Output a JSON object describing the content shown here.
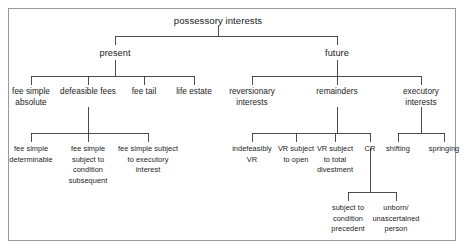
{
  "diagram": {
    "title": "possessory interests",
    "type": "tree-hierarchy",
    "frame": {
      "border_color": "#9a9a9a",
      "background": "#ffffff"
    },
    "line_color": "#3a3a3a",
    "text_color": "#1a1a1a",
    "nodes": {
      "root": "possessory interests",
      "present": "present",
      "future": "future",
      "fee_simple_absolute": "fee simple absolute",
      "defeasible_fees": "defeasible fees",
      "fee_tail": "fee tail",
      "life_estate": "life estate",
      "fee_simple_determinable": "fee simple determinable",
      "fee_simple_subject_to_condition_subsequent": "fee simple subject to condition subsequent",
      "fee_simple_subject_to_executory_interest": "fee simple subject to executory interest",
      "reversionary_interests": "reversionary interests",
      "remainders": "remainders",
      "executory_interests": "executory interests",
      "indefeasibly_vr": "indefeasibly VR",
      "vr_subject_to_open": "VR subject to open",
      "vr_subject_to_total_divestment": "VR subject to total divestment",
      "cr": "CR",
      "shifting": "shifting",
      "springing": "springing",
      "subject_to_condition_precedent": "subject to condition precedent",
      "unborn_unascertained_person": "unborn/ unascertained person"
    },
    "edges": [
      {
        "from": "root",
        "to": "present"
      },
      {
        "from": "root",
        "to": "future"
      },
      {
        "from": "present",
        "to": "fee_simple_absolute"
      },
      {
        "from": "present",
        "to": "defeasible_fees"
      },
      {
        "from": "present",
        "to": "fee_tail"
      },
      {
        "from": "present",
        "to": "life_estate"
      },
      {
        "from": "defeasible_fees",
        "to": "fee_simple_determinable"
      },
      {
        "from": "defeasible_fees",
        "to": "fee_simple_subject_to_condition_subsequent"
      },
      {
        "from": "defeasible_fees",
        "to": "fee_simple_subject_to_executory_interest"
      },
      {
        "from": "future",
        "to": "reversionary_interests"
      },
      {
        "from": "future",
        "to": "remainders"
      },
      {
        "from": "future",
        "to": "executory_interests"
      },
      {
        "from": "remainders",
        "to": "indefeasibly_vr"
      },
      {
        "from": "remainders",
        "to": "vr_subject_to_open"
      },
      {
        "from": "remainders",
        "to": "vr_subject_to_total_divestment"
      },
      {
        "from": "remainders",
        "to": "cr"
      },
      {
        "from": "executory_interests",
        "to": "shifting"
      },
      {
        "from": "executory_interests",
        "to": "springing"
      },
      {
        "from": "cr",
        "to": "subject_to_condition_precedent"
      },
      {
        "from": "cr",
        "to": "unborn_unascertained_person"
      }
    ]
  }
}
